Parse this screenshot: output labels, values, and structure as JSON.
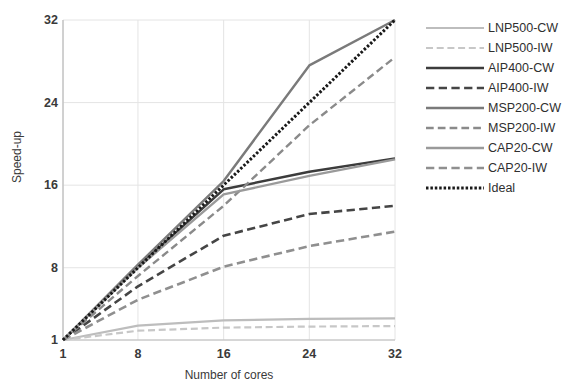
{
  "chart_data": {
    "type": "line",
    "title": "",
    "xlabel": "Number of cores",
    "ylabel": "Speed-up",
    "xlim": [
      1,
      32
    ],
    "ylim": [
      1,
      32
    ],
    "xticks": [
      1,
      8,
      16,
      24,
      32
    ],
    "yticks": [
      1,
      8,
      16,
      24,
      32
    ],
    "xtick_labels": [
      "1",
      "8",
      "16",
      "24",
      "32"
    ],
    "ytick_labels": [
      "1",
      "8",
      "16",
      "24",
      "32"
    ],
    "grid": true,
    "legend_position": "right",
    "x": [
      1,
      8,
      16,
      24,
      32
    ],
    "series": [
      {
        "name": "LNP500-CW",
        "values": [
          1,
          2.4,
          2.9,
          3.05,
          3.1
        ],
        "color": "#bdbdbd",
        "style": "solid",
        "width": 2.2
      },
      {
        "name": "LNP500-IW",
        "values": [
          1,
          1.9,
          2.2,
          2.3,
          2.35
        ],
        "color": "#c7c7c7",
        "style": "dashed",
        "width": 2.2
      },
      {
        "name": "AIP400-CW",
        "values": [
          1,
          8.1,
          15.6,
          17.3,
          18.6
        ],
        "color": "#3c3c3c",
        "style": "solid",
        "width": 2.4
      },
      {
        "name": "AIP400-IW",
        "values": [
          1,
          6.2,
          11.1,
          13.2,
          14.0
        ],
        "color": "#454545",
        "style": "dashed",
        "width": 2.6
      },
      {
        "name": "MSP200-CW",
        "values": [
          1,
          8.3,
          16.4,
          27.6,
          32.0
        ],
        "color": "#7a7a7a",
        "style": "solid",
        "width": 2.4
      },
      {
        "name": "MSP200-IW",
        "values": [
          1,
          7.2,
          14.0,
          21.8,
          28.4
        ],
        "color": "#8a8a8a",
        "style": "dashed",
        "width": 2.4
      },
      {
        "name": "CAP20-CW",
        "values": [
          1,
          8.0,
          15.1,
          16.9,
          18.5
        ],
        "color": "#9a9a9a",
        "style": "solid",
        "width": 2.4
      },
      {
        "name": "CAP20-IW",
        "values": [
          1,
          4.9,
          8.1,
          10.1,
          11.5
        ],
        "color": "#8f8f8f",
        "style": "dashed",
        "width": 2.6
      },
      {
        "name": "Ideal",
        "values": [
          1,
          8,
          16,
          24,
          32
        ],
        "color": "#1a1a1a",
        "style": "dotted",
        "width": 3.0
      }
    ]
  },
  "axes": {
    "xlabel": "Number of cores",
    "ylabel": "Speed-up",
    "xticks": [
      "1",
      "8",
      "16",
      "24",
      "32"
    ],
    "yticks": [
      "1",
      "8",
      "16",
      "24",
      "32"
    ]
  },
  "legend": {
    "entries": [
      {
        "label": "LNP500-CW"
      },
      {
        "label": "LNP500-IW"
      },
      {
        "label": "AIP400-CW"
      },
      {
        "label": "AIP400-IW"
      },
      {
        "label": "MSP200-CW"
      },
      {
        "label": "MSP200-IW"
      },
      {
        "label": "CAP20-CW"
      },
      {
        "label": "CAP20-IW"
      },
      {
        "label": "Ideal"
      }
    ]
  },
  "colors": {
    "background": "#ffffff",
    "grid": "#e4e4e4",
    "axis": "#bbbbbb",
    "text": "#3a3a3a"
  }
}
